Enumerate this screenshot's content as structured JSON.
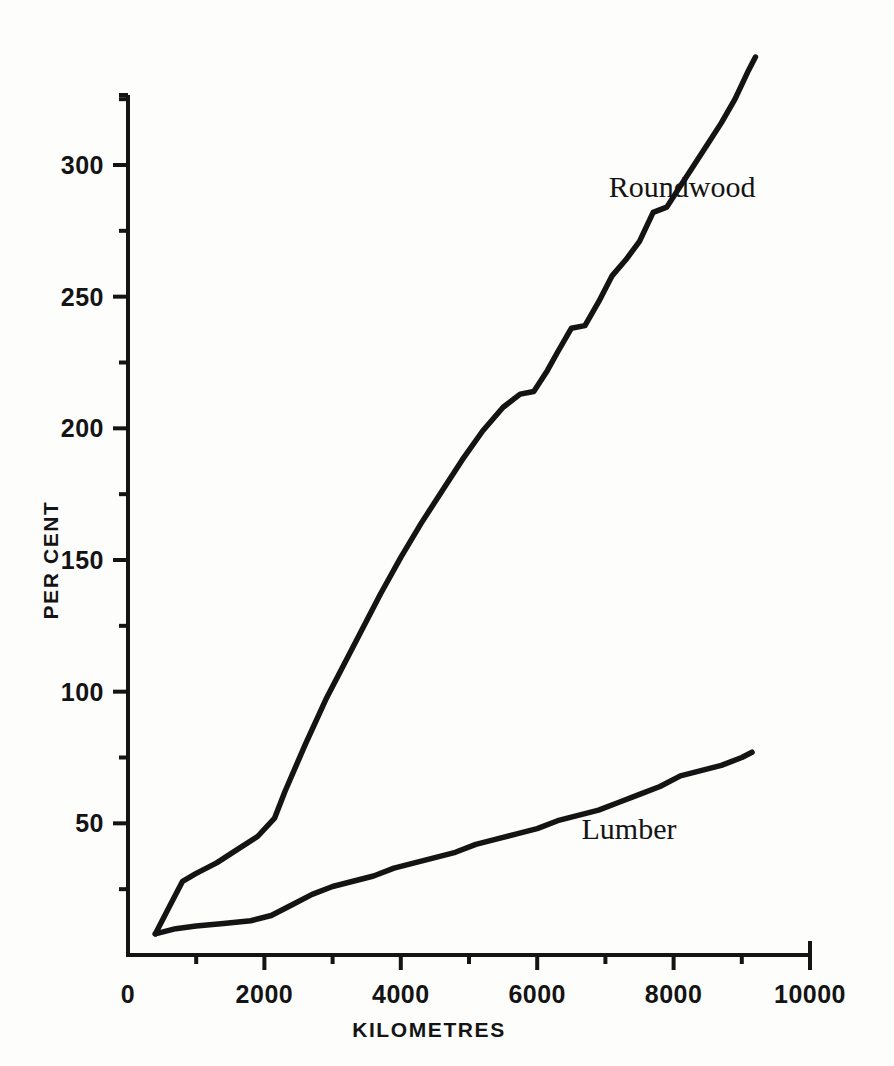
{
  "figure": {
    "background_color": "#fdfdfc",
    "ink_color": "#141414"
  },
  "chart_data": {
    "type": "line",
    "title": "",
    "subtitle": "",
    "xlabel": "KILOMETRES",
    "ylabel": "PER CENT",
    "xlim": [
      0,
      10000
    ],
    "ylim": [
      0,
      345
    ],
    "grid": false,
    "legend_position": "inline-annotation",
    "x_ticks_major": [
      0,
      2000,
      4000,
      6000,
      8000,
      10000
    ],
    "x_tick_labels": [
      "0",
      "2000",
      "4000",
      "6000",
      "8000",
      "10000"
    ],
    "x_ticks_minor": [
      1000,
      3000,
      5000,
      7000,
      9000
    ],
    "y_ticks_major": [
      50,
      100,
      150,
      200,
      250,
      300
    ],
    "y_tick_labels": [
      "50",
      "100",
      "150",
      "200",
      "250",
      "300"
    ],
    "y_ticks_minor": [
      25,
      75,
      125,
      175,
      225,
      275,
      325
    ],
    "series": [
      {
        "name": "Roundwood",
        "label": "Roundwood",
        "label_x": 7050,
        "label_y": 288,
        "x": [
          400,
          600,
          800,
          1000,
          1300,
          1600,
          1900,
          2150,
          2300,
          2600,
          2900,
          3100,
          3400,
          3700,
          4000,
          4300,
          4600,
          4900,
          5200,
          5500,
          5750,
          5950,
          6150,
          6300,
          6500,
          6700,
          6900,
          7100,
          7300,
          7500,
          7700,
          7900,
          8100,
          8300,
          8500,
          8700,
          8900,
          9100,
          9200
        ],
        "y": [
          8,
          18,
          28,
          31,
          35,
          40,
          45,
          52,
          62,
          80,
          97,
          107,
          122,
          137,
          151,
          164,
          176,
          188,
          199,
          208,
          213,
          214,
          222,
          229,
          238,
          239,
          248,
          258,
          264,
          271,
          282,
          284,
          292,
          300,
          308,
          316,
          325,
          336,
          341
        ]
      },
      {
        "name": "Lumber",
        "label": "Lumber",
        "label_x": 6650,
        "label_y": 44,
        "x": [
          400,
          700,
          1000,
          1400,
          1800,
          2100,
          2400,
          2700,
          3000,
          3300,
          3600,
          3900,
          4200,
          4500,
          4800,
          5100,
          5400,
          5700,
          6000,
          6300,
          6600,
          6900,
          7200,
          7500,
          7800,
          8100,
          8400,
          8700,
          9000,
          9150
        ],
        "y": [
          8,
          10,
          11,
          12,
          13,
          15,
          19,
          23,
          26,
          28,
          30,
          33,
          35,
          37,
          39,
          42,
          44,
          46,
          48,
          51,
          53,
          55,
          58,
          61,
          64,
          68,
          70,
          72,
          75,
          77
        ]
      }
    ]
  }
}
